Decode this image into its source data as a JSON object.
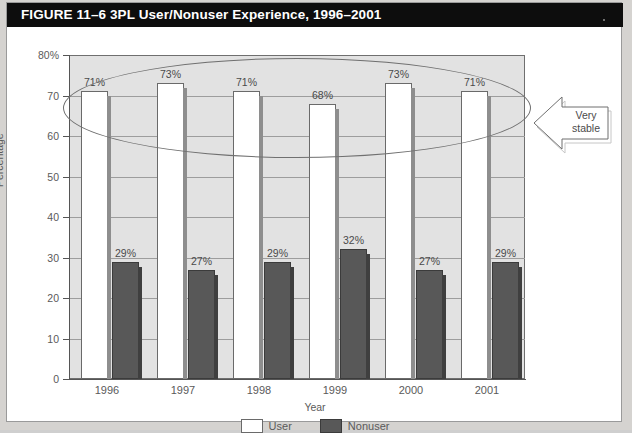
{
  "figure": {
    "title": "FIGURE 11–6 3PL User/Nonuser Experience, 1996–2001"
  },
  "annotation": {
    "callout_line1": "Very",
    "callout_line2": "stable",
    "callout_shape": "left-arrow",
    "ellipse_highlight": "oval around user series"
  },
  "legend": {
    "items": [
      {
        "label": "User",
        "color": "#ffffff"
      },
      {
        "label": "Nonuser",
        "color": "#585858"
      }
    ]
  },
  "chart_data": {
    "type": "bar",
    "title": "3PL User/Nonuser Experience, 1996–2001",
    "xlabel": "Year",
    "ylabel": "Percentage",
    "categories": [
      "1996",
      "1997",
      "1998",
      "1999",
      "2000",
      "2001"
    ],
    "series": [
      {
        "name": "User",
        "color": "#ffffff",
        "values": [
          71,
          73,
          71,
          68,
          73,
          71
        ],
        "labels": [
          "71%",
          "73%",
          "71%",
          "68%",
          "73%",
          "71%"
        ]
      },
      {
        "name": "Nonuser",
        "color": "#585858",
        "values": [
          29,
          27,
          29,
          32,
          27,
          29
        ],
        "labels": [
          "29%",
          "27%",
          "29%",
          "32%",
          "27%",
          "29%"
        ]
      }
    ],
    "ylim": [
      0,
      80
    ],
    "yticks": [
      0,
      10,
      20,
      30,
      40,
      50,
      60,
      70,
      80
    ],
    "ytick_labels": [
      "0",
      "10",
      "20",
      "30",
      "40",
      "50",
      "60",
      "70",
      "80%"
    ],
    "grid": true,
    "legend_position": "bottom"
  }
}
